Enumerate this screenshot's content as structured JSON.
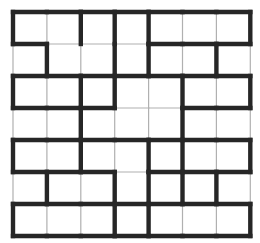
{
  "figure": {
    "name": "maze-grid-figure",
    "width": 260,
    "height": 243,
    "background_color": "#ffffff"
  },
  "grid": {
    "columns": 7,
    "rows": 7,
    "origin_x": 13,
    "origin_y": 12,
    "cell_width": 33.9,
    "cell_height": 32.0,
    "thin_color": "#b0b0b0",
    "thick_color": "#262626",
    "thin_width": 1.2,
    "thick_width": 4.4,
    "horizontal_walls": [
      [
        1,
        1,
        1,
        1,
        1,
        1,
        1
      ],
      [
        1,
        0,
        0,
        0,
        1,
        1,
        1
      ],
      [
        1,
        1,
        1,
        1,
        1,
        1,
        1
      ],
      [
        1,
        1,
        1,
        0,
        0,
        1,
        1
      ],
      [
        1,
        1,
        1,
        1,
        1,
        1,
        1
      ],
      [
        1,
        1,
        1,
        0,
        1,
        1,
        1
      ],
      [
        1,
        1,
        1,
        1,
        1,
        1,
        1
      ],
      [
        1,
        1,
        1,
        1,
        1,
        1,
        1
      ]
    ],
    "vertical_walls": [
      [
        1,
        0,
        1,
        1,
        1,
        0,
        0,
        1
      ],
      [
        0,
        1,
        0,
        1,
        1,
        0,
        1,
        0
      ],
      [
        1,
        0,
        1,
        1,
        0,
        1,
        0,
        1
      ],
      [
        0,
        0,
        1,
        0,
        0,
        1,
        0,
        0
      ],
      [
        1,
        0,
        1,
        0,
        1,
        1,
        0,
        1
      ],
      [
        0,
        1,
        0,
        1,
        1,
        1,
        1,
        0
      ],
      [
        1,
        0,
        0,
        1,
        1,
        0,
        0,
        1
      ]
    ]
  },
  "cells": {
    "label": "maze-cell",
    "fill": "#ffffff"
  }
}
